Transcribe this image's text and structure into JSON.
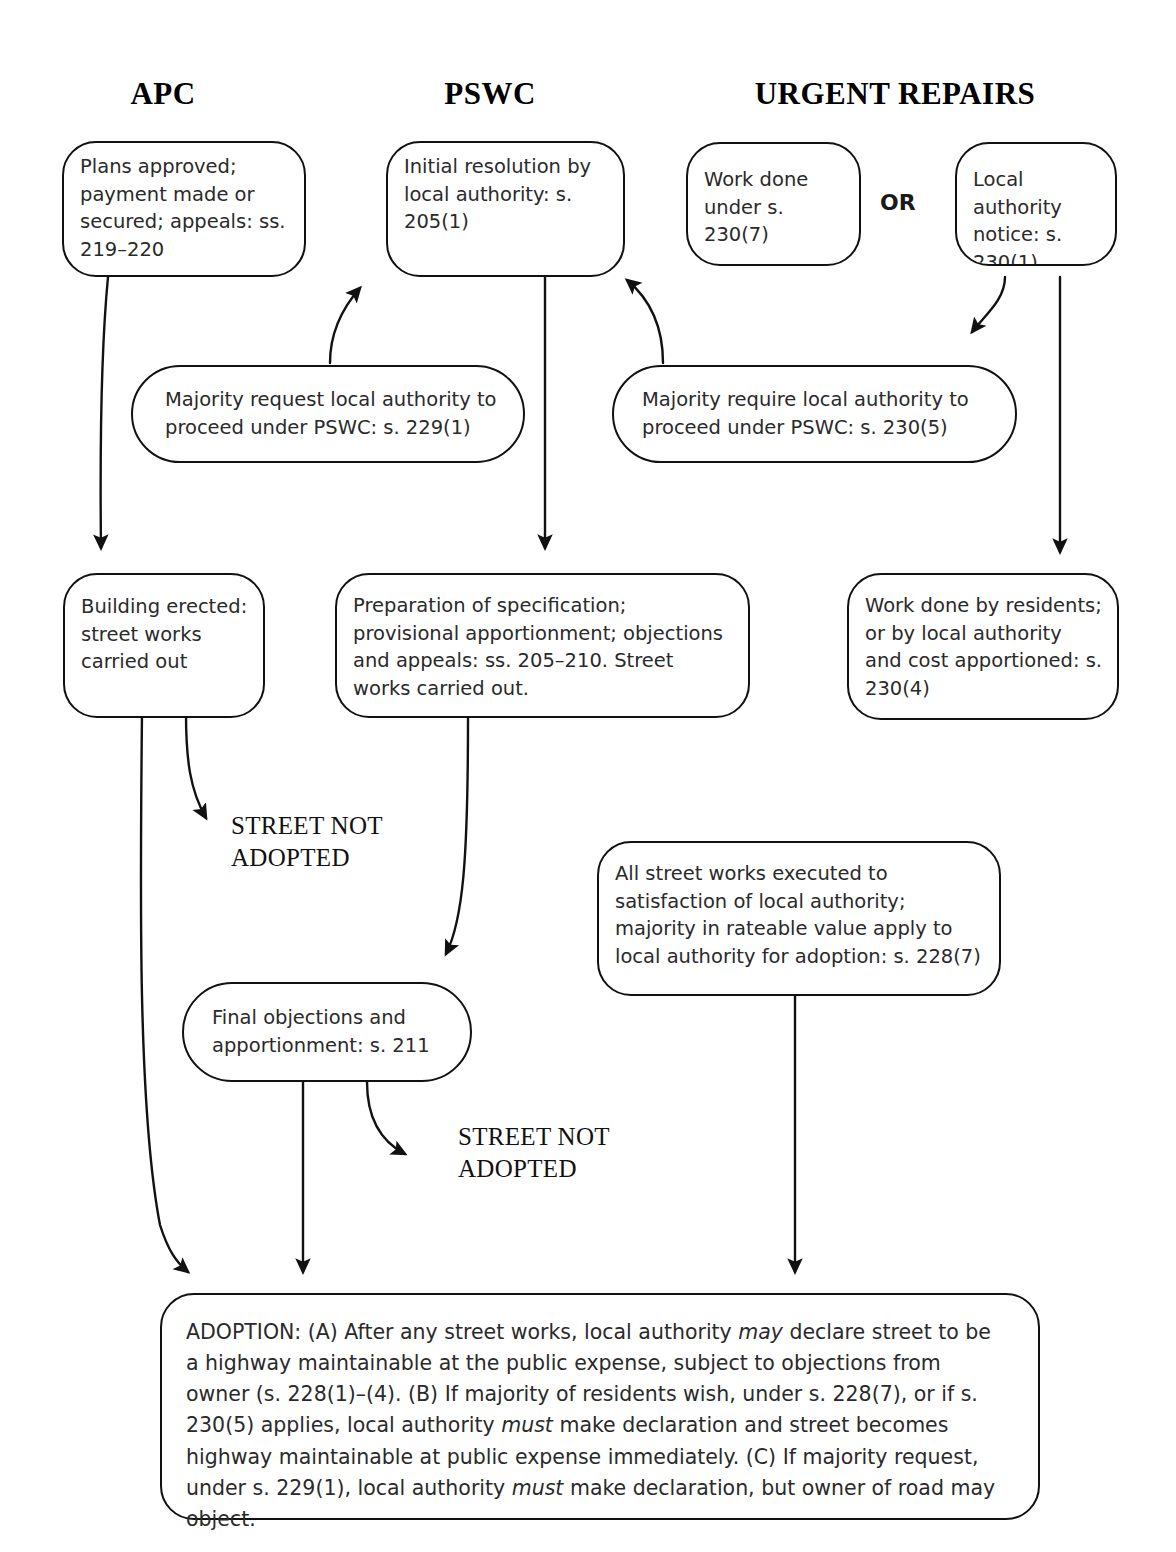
{
  "diagram": {
    "columns": [
      {
        "id": "apc",
        "label": "APC"
      },
      {
        "id": "pswc",
        "label": "PSWC"
      },
      {
        "id": "urgent",
        "label": "URGENT REPAIRS"
      }
    ],
    "connector_label": "OR",
    "nodes": [
      {
        "id": "plans-approved",
        "text": "Plans approved; payment made or secured; appeals: ss. 219–220"
      },
      {
        "id": "initial-resolution",
        "text": "Initial resolution by local authority: s. 205(1)"
      },
      {
        "id": "work-done-230-7",
        "text": "Work done under s. 230(7)"
      },
      {
        "id": "local-authority-notice",
        "text": "Local authority notice: s. 230(1)"
      },
      {
        "id": "majority-request",
        "text": "Majority request local authority to proceed under PSWC: s. 229(1)"
      },
      {
        "id": "majority-require",
        "text": "Majority require local authority to proceed under PSWC: s. 230(5)"
      },
      {
        "id": "building-erected",
        "text": "Building erected: street works carried out"
      },
      {
        "id": "preparation-specification",
        "text": "Preparation of specification; provisional apportionment; objections and appeals: ss. 205–210. Street works carried out."
      },
      {
        "id": "work-done-residents",
        "text": "Work done by residents; or by local authority and cost apportioned: s. 230(4)"
      },
      {
        "id": "all-street-works",
        "text": "All street works executed to satisfaction of local authority; majority in rateable value apply to local authority for adoption: s. 228(7)"
      },
      {
        "id": "final-objections",
        "text": "Final objections and apportionment: s. 211"
      }
    ],
    "terminal_labels": [
      {
        "id": "street-not-adopted-1",
        "text": "STREET NOT\nADOPTED"
      },
      {
        "id": "street-not-adopted-2",
        "text": "STREET NOT\nADOPTED"
      }
    ],
    "adoption": {
      "id": "adoption-box",
      "segments": [
        {
          "text": "ADOPTION: (A) After any street works, local authority ",
          "style": "normal"
        },
        {
          "text": "may",
          "style": "italic"
        },
        {
          "text": " declare street to be a highway maintainable at the public expense, subject to objections from owner (s. 228(1)–(4). (B) If majority of residents wish, under s. 228(7), or if s. 230(5) applies, local authority ",
          "style": "normal"
        },
        {
          "text": "must",
          "style": "italic"
        },
        {
          "text": " make declaration and street becomes highway maintainable at public expense immediately. (C) If majority request, under s. 229(1), local authority ",
          "style": "normal"
        },
        {
          "text": "must",
          "style": "italic"
        },
        {
          "text": " make declaration, but owner of road may object.",
          "style": "normal"
        }
      ],
      "plain_text": "ADOPTION: (A) After any street works, local authority may declare street to be a highway maintainable at the public expense, subject to objections from owner (s. 228(1)–(4). (B) If majority of residents wish, under s. 228(7), or if s. 230(5) applies, local authority must make declaration and street becomes highway maintainable at public expense immediately. (C) If majority request, under s. 229(1), local authority must make declaration, but owner of road may object."
    },
    "colors": {
      "stroke": "#111111",
      "text": "#2a2a2a",
      "background": "#ffffff"
    }
  }
}
